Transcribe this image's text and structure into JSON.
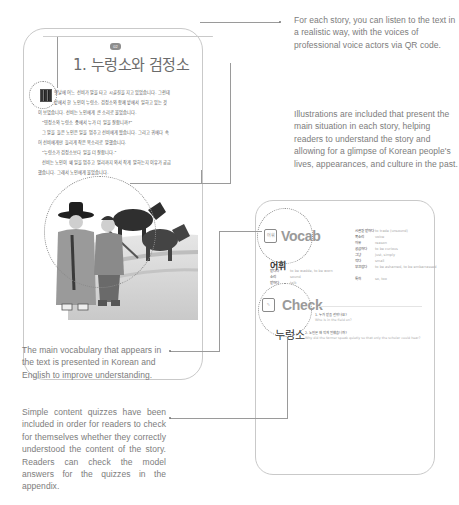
{
  "story_page": {
    "badge": "02",
    "title": "1. 누렁소와 검정소",
    "paragraphs": [
      "옛날에 어느 선비가 말을 타고 시골길을 지고 있었습니다. 그런데",
      "밭에서 한 노인이 누렁소, 검정소와 함께 밭에서 일하고 있는 것",
      "이 보였습니다. 선비는 노인에게 큰 소리로 물었습니다.",
      "\"영정소와 누렁소 중에서 누가 더 일을 잘합니까?\"",
      "그 말을 들은 노인은 일을 멈추고 선비에게 왔습니다. 그리고 귀에다 속",
      "어 선비에게만 들리게 작은 목소리로 말했습니다.",
      "\"누렁소가 검정소보다 일을 더 잘합니다.\"",
      "선비는 노인이 왜 일을 멈추고 멀리까지 와서 작게 말하는지 이유가 궁금",
      "했습니다. 그래서 노인에게 물었습니다."
    ],
    "qr_label": "QR code",
    "illustration": "illustration: two men in traditional hanbok, one in a gat hat, beside two oxen in a field"
  },
  "vocab_page": {
    "vocab_section_title": "Vocab",
    "vocab_icon": "어휘",
    "check_section_title": "Check",
    "check_icon": "check-note",
    "handwritten_header": "어휘",
    "handwritten_footer": "누렁소",
    "vocab_left": [
      {
        "korean": "밭다다",
        "english": "to be wadde, to be worn"
      },
      {
        "korean": "소리",
        "english": "sound"
      },
      {
        "korean": "밭하다",
        "english": "talk"
      }
    ],
    "vocab_right": [
      {
        "korean": "시골길 밭하다",
        "english": "to trade (unsound)"
      },
      {
        "korean": "목소리",
        "english": "voice"
      },
      {
        "korean": "이유",
        "english": "reason"
      },
      {
        "korean": "궁금하다",
        "english": "to be curious"
      },
      {
        "korean": "그냥",
        "english": "just, simply"
      },
      {
        "korean": "작다",
        "english": "small"
      },
      {
        "korean": "부끄럽다",
        "english": "to be ashamed, to be embarrassed"
      },
      {
        "korean": "특히",
        "english": "so, too"
      }
    ],
    "quiz": [
      {
        "q": "1. 누가 밭을 갈았나요?",
        "a": "Who is in the field on?"
      },
      {
        "q": "2. 노인은 왜 작게 말했습니까?",
        "a": "Why did the farmer speak quietly so that only the scholar could hear?"
      }
    ]
  },
  "annotations": {
    "qr_note": "For each story, you can listen to the text in a realistic way, with the voices of professional voice actors via QR code.",
    "illustration_note": "Illustrations are included that present the main situation in each story, helping readers to understand the story and allowing for a glimpse of Korean people's lives, appearances, and culture in the past.",
    "vocab_note": "The main vocabulary that appears in the text is presented in Korean and English to improve understanding.",
    "quiz_note": "Simple content quizzes have been included in order for readers to check for themselves whether they correctly understood the content of the story. Readers can check the model answers for the quizzes in the appendix."
  },
  "colors": {
    "text_gray": "#7c7c7c",
    "border_gray": "#c9c9c9",
    "line_gray": "#9a9a9a"
  }
}
